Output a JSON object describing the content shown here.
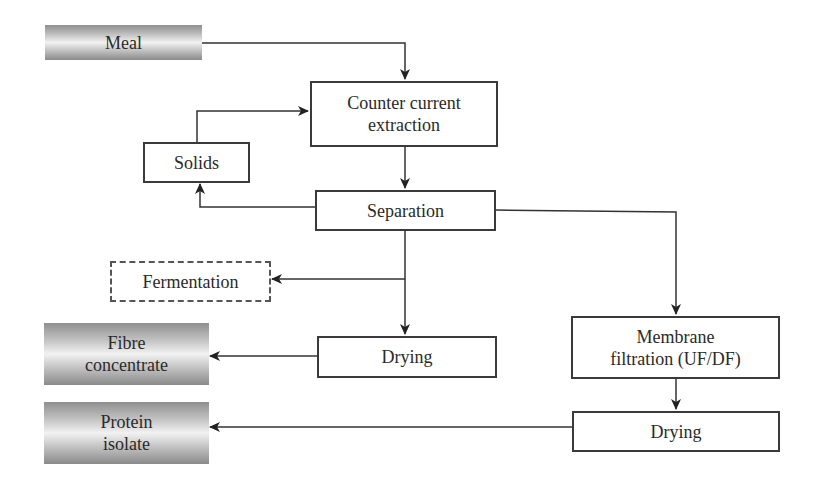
{
  "diagram": {
    "nodes": {
      "meal": {
        "label": "Meal",
        "style": "shaded"
      },
      "extraction": {
        "line1": "Counter current",
        "line2": "extraction",
        "style": "plain"
      },
      "solids": {
        "label": "Solids",
        "style": "plain"
      },
      "separation": {
        "label": "Separation",
        "style": "plain"
      },
      "fermentation": {
        "label": "Fermentation",
        "style": "dashed"
      },
      "drying_fibre": {
        "label": "Drying",
        "style": "plain"
      },
      "fibre_concentrate": {
        "line1": "Fibre",
        "line2": "concentrate",
        "style": "shaded"
      },
      "membrane": {
        "line1": "Membrane",
        "line2": "filtration (UF/DF)",
        "style": "plain"
      },
      "drying_protein": {
        "label": "Drying",
        "style": "plain"
      },
      "protein_isolate": {
        "line1": "Protein",
        "line2": "isolate",
        "style": "shaded"
      }
    },
    "edges": [
      {
        "from": "Meal",
        "to": "Counter current extraction"
      },
      {
        "from": "Solids",
        "to": "Counter current extraction"
      },
      {
        "from": "Counter current extraction",
        "to": "Separation"
      },
      {
        "from": "Separation",
        "to": "Solids"
      },
      {
        "from": "Separation",
        "to": "Fermentation",
        "style": "optional"
      },
      {
        "from": "Separation",
        "to": "Drying"
      },
      {
        "from": "Drying",
        "to": "Fibre concentrate"
      },
      {
        "from": "Separation",
        "to": "Membrane filtration (UF/DF)"
      },
      {
        "from": "Membrane filtration (UF/DF)",
        "to": "Drying"
      },
      {
        "from": "Drying",
        "to": "Protein isolate"
      }
    ],
    "colors": {
      "line": "#333333",
      "box_border": "#3a3a3a",
      "shade_dark": "#8a8a8a",
      "shade_light": "#f2f2f2"
    }
  }
}
